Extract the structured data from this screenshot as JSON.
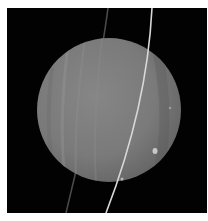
{
  "image": {
    "subject": "Uranus with rings",
    "alt": "Grayscale image of a banded gas giant planet crossed by thin rings against black space",
    "colors": {
      "background": "#020202",
      "planet_light": "#8a8a8a",
      "planet_mid": "#7a7a7a",
      "planet_dark": "#5e5e5e",
      "ring_bright": "#d8d8d8",
      "ring_faint": "#5a5a5a",
      "border": "#ffffff"
    }
  }
}
